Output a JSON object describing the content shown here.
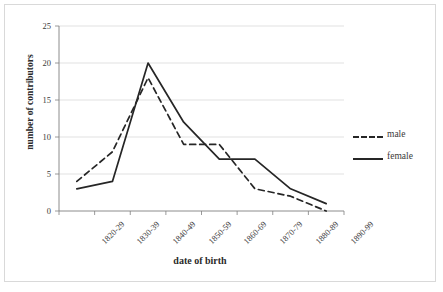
{
  "chart_data": {
    "type": "line",
    "title": "",
    "xlabel": "date of birth",
    "ylabel": "number of contributors",
    "categories": [
      "1820-29",
      "1830-39",
      "1840-49",
      "1850-59",
      "1860-69",
      "1870-79",
      "1880-89",
      "1890-99"
    ],
    "series": [
      {
        "name": "male",
        "style": "dashed",
        "color": "#262626",
        "values": [
          4,
          8,
          18,
          9,
          9,
          3,
          2,
          0
        ]
      },
      {
        "name": "female",
        "style": "solid",
        "color": "#262626",
        "values": [
          3,
          4,
          20,
          12,
          7,
          7,
          3,
          1
        ]
      }
    ],
    "ylim": [
      0,
      25
    ],
    "yticks": [
      0,
      5,
      10,
      15,
      20,
      25
    ],
    "grid": "horizontal",
    "legend_position": "right"
  },
  "legend": {
    "items": [
      {
        "label": "male"
      },
      {
        "label": "female"
      }
    ]
  },
  "colors": {
    "line": "#262626",
    "grid": "#d9d9d9",
    "axis": "#808080",
    "border": "#d9d9d9",
    "text": "#3a3a3a"
  }
}
